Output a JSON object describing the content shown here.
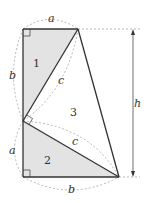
{
  "diagram": {
    "labels": {
      "top_a": "a",
      "left_b": "b",
      "left_a": "a",
      "bottom_b": "b",
      "hyp_c_upper": "c",
      "hyp_c_lower": "c",
      "height": "h"
    },
    "regions": {
      "tri1": "1",
      "tri2": "2",
      "tri3": "3"
    },
    "colors": {
      "shade": "#e3e3e3",
      "stroke": "#333333",
      "dashed": "#999999"
    }
  }
}
